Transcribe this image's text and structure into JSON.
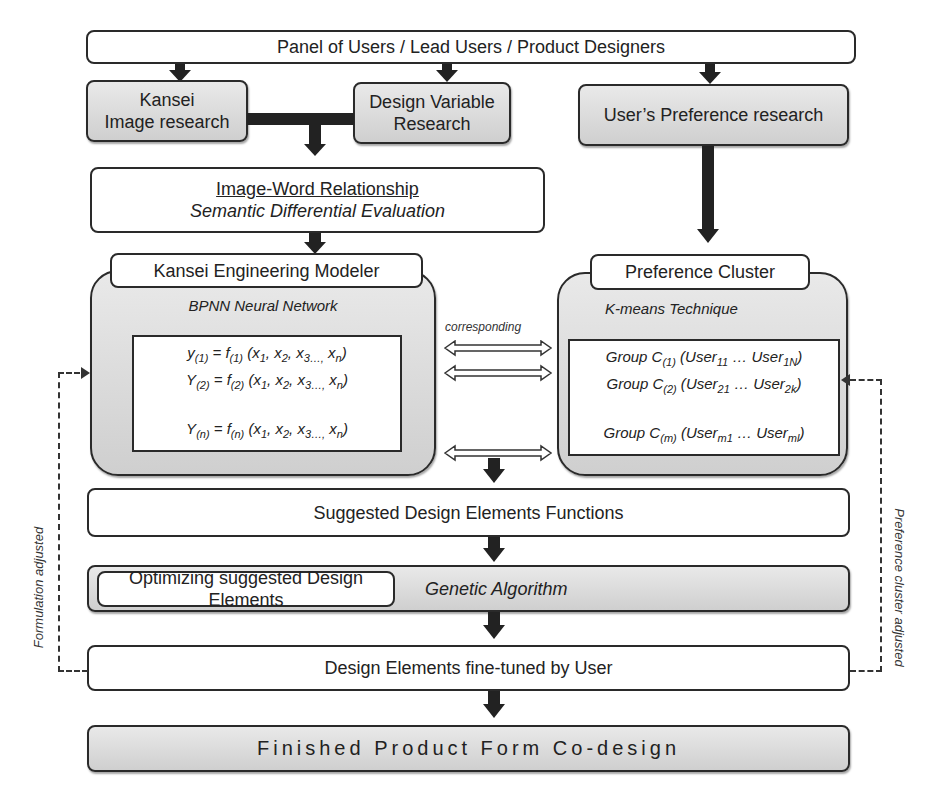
{
  "top": {
    "label": "Panel of Users / Lead Users / Product Designers"
  },
  "research": {
    "kansei": [
      "Kansei",
      "Image research"
    ],
    "design_variable": [
      "Design Variable",
      "Research"
    ],
    "preference": "User’s Preference  research"
  },
  "image_word": {
    "title": "Image-Word Relationship",
    "subtitle": "Semantic Differential Evaluation"
  },
  "kansei_modeler": {
    "label": "Kansei Engineering Modeler",
    "method": "BPNN Neural Network",
    "formulas": [
      {
        "lhs": "y",
        "lhs_sub": "(1)",
        "f_sub": "(1)"
      },
      {
        "lhs": "Y",
        "lhs_sub": "(2)",
        "f_sub": "(2)"
      },
      {
        "lhs": "Y",
        "lhs_sub": "(n)",
        "f_sub": "(n)"
      }
    ],
    "formula_text": {
      "eq": " = f",
      "args_open": " (x",
      "x1": "1",
      "x2": "2",
      "x3": "3…,",
      "xn": "n",
      "close": ")"
    }
  },
  "corresponding": {
    "label": "corresponding"
  },
  "preference_cluster": {
    "label": "Preference Cluster",
    "method": "K-means Technique",
    "groups": [
      {
        "c": "(1)",
        "a": "11",
        "b": "1N"
      },
      {
        "c": "(2)",
        "a": "21",
        "b": "2k"
      },
      {
        "c": "(m)",
        "a": "m1",
        "b": "ml"
      }
    ],
    "text": {
      "group": "Group C",
      "user": "User",
      "dots": " … "
    }
  },
  "suggested": {
    "label": "Suggested Design Elements Functions"
  },
  "optimizing": {
    "label": "Optimizing suggested Design Elements",
    "method": "Genetic Algorithm"
  },
  "fine_tuned": {
    "label": "Design Elements fine-tuned by User"
  },
  "finished": {
    "label": "Finished Product Form Co-design"
  },
  "side_labels": {
    "left": "Formulation adjusted",
    "right": "Preference cluster adjusted"
  }
}
